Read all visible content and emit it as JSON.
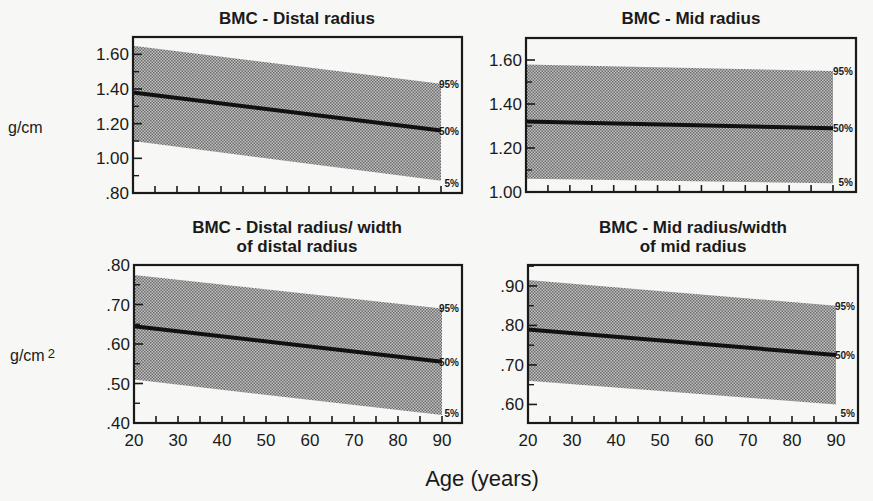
{
  "figure": {
    "xlabel": "Age (years)",
    "units": [
      {
        "label": "g/cm",
        "sup": ""
      },
      {
        "label": "g/cm",
        "sup": "2"
      }
    ],
    "colors": {
      "background": "#f7f7f5",
      "ink": "#1a1a1a",
      "band_fill": "#9a9a9a",
      "median_line": "#111111"
    }
  },
  "chart_data": [
    {
      "type": "area",
      "title": "BMC - Distal radius",
      "title_lines": [
        "BMC - Distal radius"
      ],
      "xlabel": "Age (years)",
      "ylabel": "g/cm",
      "x": [
        20,
        90
      ],
      "xlim": [
        20,
        95
      ],
      "ylim": [
        0.8,
        1.7
      ],
      "yticks": [
        0.8,
        1.0,
        1.2,
        1.4,
        1.6
      ],
      "ytick_labels": [
        ".80",
        "1.00",
        "1.20",
        "1.40",
        "1.60"
      ],
      "xticks": [
        20,
        30,
        40,
        50,
        60,
        70,
        80,
        90
      ],
      "series": [
        {
          "name": "95%",
          "values": [
            1.65,
            1.43
          ]
        },
        {
          "name": "50%",
          "values": [
            1.38,
            1.16
          ]
        },
        {
          "name": "5%",
          "values": [
            1.1,
            0.87
          ]
        }
      ],
      "annotations": [
        "95%",
        "50%",
        "5%"
      ],
      "grid": false
    },
    {
      "type": "area",
      "title": "BMC - Mid radius",
      "title_lines": [
        "BMC - Mid radius"
      ],
      "xlabel": "Age (years)",
      "ylabel": "g/cm",
      "x": [
        20,
        90
      ],
      "xlim": [
        20,
        95
      ],
      "ylim": [
        1.0,
        1.7
      ],
      "yticks": [
        1.0,
        1.2,
        1.4,
        1.6
      ],
      "ytick_labels": [
        "1.00",
        "1.20",
        "1.40",
        "1.60"
      ],
      "xticks": [
        20,
        30,
        40,
        50,
        60,
        70,
        80,
        90
      ],
      "series": [
        {
          "name": "95%",
          "values": [
            1.58,
            1.55
          ]
        },
        {
          "name": "50%",
          "values": [
            1.32,
            1.29
          ]
        },
        {
          "name": "5%",
          "values": [
            1.06,
            1.04
          ]
        }
      ],
      "annotations": [
        "95%",
        "50%",
        "5%"
      ],
      "grid": false
    },
    {
      "type": "area",
      "title": "BMC - Distal radius/ width of distal radius",
      "title_lines": [
        "BMC - Distal radius/ width",
        "of distal radius"
      ],
      "xlabel": "Age (years)",
      "ylabel": "g/cm2",
      "x": [
        20,
        90
      ],
      "xlim": [
        20,
        95
      ],
      "ylim": [
        0.4,
        0.8
      ],
      "yticks": [
        0.4,
        0.5,
        0.6,
        0.7,
        0.8
      ],
      "ytick_labels": [
        ".40",
        ".50",
        ".60",
        ".70",
        ".80"
      ],
      "xticks": [
        20,
        30,
        40,
        50,
        60,
        70,
        80,
        90
      ],
      "series": [
        {
          "name": "95%",
          "values": [
            0.775,
            0.69
          ]
        },
        {
          "name": "50%",
          "values": [
            0.645,
            0.555
          ]
        },
        {
          "name": "5%",
          "values": [
            0.51,
            0.42
          ]
        }
      ],
      "annotations": [
        "95%",
        "50%",
        "5%"
      ],
      "grid": false
    },
    {
      "type": "area",
      "title": "BMC - Mid radius/width of mid radius",
      "title_lines": [
        "BMC - Mid radius/width",
        "of mid radius"
      ],
      "xlabel": "Age (years)",
      "ylabel": "g/cm2",
      "x": [
        20,
        90
      ],
      "xlim": [
        20,
        95
      ],
      "ylim": [
        0.553,
        0.953
      ],
      "yticks": [
        0.6,
        0.7,
        0.8,
        0.9
      ],
      "ytick_labels": [
        ".60",
        ".70",
        ".80",
        ".90"
      ],
      "xticks": [
        20,
        30,
        40,
        50,
        60,
        70,
        80,
        90
      ],
      "series": [
        {
          "name": "95%",
          "values": [
            0.915,
            0.85
          ]
        },
        {
          "name": "50%",
          "values": [
            0.79,
            0.725
          ]
        },
        {
          "name": "5%",
          "values": [
            0.66,
            0.6
          ]
        }
      ],
      "annotations": [
        "95%",
        "50%",
        "5%"
      ],
      "grid": false
    }
  ]
}
